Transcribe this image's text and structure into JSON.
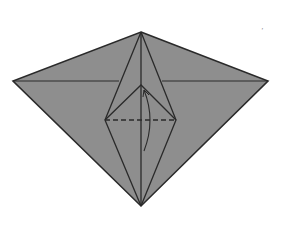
{
  "diagram": {
    "type": "origami-fold-step",
    "paper_color": "#8e8e8e",
    "line_color": "#2a2a2a",
    "background": "#ffffff",
    "vertices": {
      "top": [
        141,
        32
      ],
      "left": [
        13,
        81
      ],
      "right": [
        268,
        81
      ],
      "bottom": [
        141,
        206
      ],
      "inner_top": [
        141,
        85
      ],
      "inner_left": [
        105,
        120
      ],
      "inner_right": [
        176,
        120
      ]
    },
    "lines": {
      "valley_fold": "dashed horizontal line between inner_left and inner_right",
      "arrow": "curved arrow indicating fold upward along center"
    },
    "mark": "’"
  }
}
